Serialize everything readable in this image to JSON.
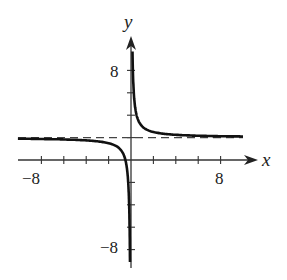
{
  "chart_data": {
    "type": "line",
    "title": "",
    "xlabel": "x",
    "ylabel": "y",
    "xlim": [
      -10,
      11
    ],
    "ylim": [
      -11,
      11
    ],
    "grid": false,
    "x_tick_step": 2,
    "y_tick_step": 2,
    "x_tick_labels": [
      {
        "value": -8,
        "label": "−8"
      },
      {
        "value": 8,
        "label": "8"
      }
    ],
    "y_tick_labels": [
      {
        "value": 8,
        "label": "8"
      },
      {
        "value": -8,
        "label": "−8"
      }
    ],
    "asymptotes": [
      {
        "type": "horizontal",
        "y": 2,
        "style": "dashed"
      },
      {
        "type": "vertical",
        "x": 0
      }
    ],
    "series": [
      {
        "name": "right branch",
        "x": [
          0.1,
          0.15,
          0.2,
          0.3,
          0.5,
          0.75,
          1,
          1.5,
          2,
          3,
          4,
          6,
          8,
          10
        ],
        "y": [
          12,
          8.7,
          7,
          5.3,
          4,
          3.3,
          3,
          2.67,
          2.5,
          2.33,
          2.25,
          2.17,
          2.13,
          2.1
        ]
      },
      {
        "name": "left branch",
        "x": [
          -10,
          -8,
          -6,
          -4,
          -3,
          -2,
          -1.5,
          -1,
          -0.75,
          -0.5,
          -0.3,
          -0.2,
          -0.15,
          -0.1
        ],
        "y": [
          1.9,
          1.88,
          1.83,
          1.75,
          1.67,
          1.5,
          1.33,
          1,
          0.67,
          0,
          -1.33,
          -3,
          -4.67,
          -8
        ]
      }
    ],
    "labels": {
      "x_axis": "x",
      "y_axis": "y",
      "x_neg": "−8",
      "x_pos": "8",
      "y_pos": "8",
      "y_neg": "−8"
    }
  }
}
